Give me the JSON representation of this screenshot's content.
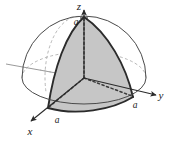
{
  "figure": {
    "background_color": "#ffffff",
    "shade_color": "#c6c6c6",
    "outline_color": "#2b2b2b",
    "hidden_line_color": "#9b9b9b",
    "radius_symbol": "a"
  },
  "axes": [
    {
      "id": "z",
      "label": "z",
      "direction": "up",
      "tick_label": "a"
    },
    {
      "id": "y",
      "label": "y",
      "direction": "right",
      "tick_label": "a"
    },
    {
      "id": "x",
      "label": "x",
      "direction": "down-left",
      "tick_label": "a"
    }
  ],
  "labels": {
    "z_axis": "z",
    "y_axis": "y",
    "x_axis": "x",
    "z_tick": "a",
    "y_tick": "a",
    "x_tick": "a"
  }
}
